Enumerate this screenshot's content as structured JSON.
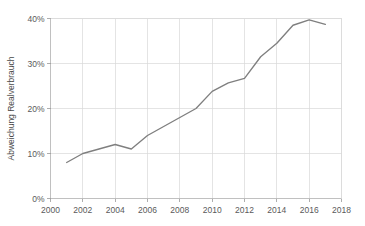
{
  "chart_data": {
    "type": "line",
    "title": "",
    "xlabel": "",
    "ylabel": "Abweichung Realverbrauch",
    "xlim": [
      2000,
      2018
    ],
    "ylim": [
      0,
      40
    ],
    "xticks": [
      2000,
      2002,
      2004,
      2006,
      2008,
      2010,
      2012,
      2014,
      2016,
      2018
    ],
    "xtick_labels": [
      "2000",
      "2002",
      "2004",
      "2006",
      "2008",
      "2010",
      "2012",
      "2014",
      "2016",
      "2018"
    ],
    "yticks": [
      0,
      10,
      20,
      30,
      40
    ],
    "ytick_labels": [
      "0%",
      "10%",
      "20%",
      "30%",
      "40%"
    ],
    "grid": true,
    "legend": false,
    "legend_position": "none",
    "series": [
      {
        "name": "Abweichung Realverbrauch",
        "color": "#7f7f7f",
        "x": [
          2001,
          2002,
          2003,
          2004,
          2005,
          2006,
          2007,
          2008,
          2009,
          2010,
          2011,
          2012,
          2013,
          2014,
          2015,
          2016,
          2017
        ],
        "values": [
          8.0,
          10.0,
          11.0,
          12.0,
          11.0,
          14.0,
          16.0,
          18.0,
          20.0,
          23.8,
          25.7,
          26.7,
          31.5,
          34.5,
          38.5,
          39.7,
          38.7
        ]
      }
    ]
  },
  "axes": {
    "ytick_unit": "%",
    "xtick_step": 2,
    "ytick_step": 10
  },
  "colors": {
    "series": "#7f7f7f",
    "grid": "#d9d9d9",
    "axis": "#b0b0b0",
    "text": "#5a5a5a",
    "background": "#ffffff"
  }
}
